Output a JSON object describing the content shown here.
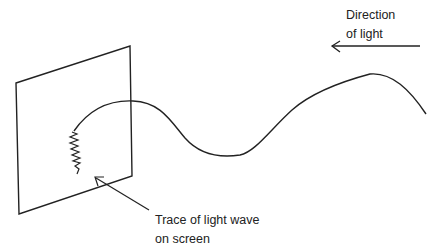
{
  "diagram": {
    "labels": {
      "direction_line1": "Direction",
      "direction_line2": "of light",
      "trace_line1": "Trace of light wave",
      "trace_line2": "on screen"
    },
    "elements": {
      "screen": "rectangular screen in perspective",
      "wave": "sinusoidal light wave travelling left",
      "trace": "zigzag trace on screen",
      "direction_arrow": "arrow pointing left"
    },
    "colors": {
      "stroke": "#222222",
      "background": "#ffffff"
    }
  }
}
